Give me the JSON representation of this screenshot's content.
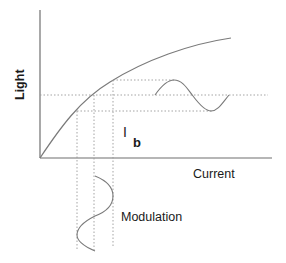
{
  "diagram": {
    "type": "laser light-current characteristic with modulation",
    "y_axis_label": "Light",
    "x_axis_label": "Current",
    "bias_label_main": "I",
    "bias_label_sub": "b",
    "modulation_label": "Modulation",
    "colors": {
      "axis": "#6f6f6f",
      "curve": "#7a7a7a",
      "guides": "#9a9a9a",
      "text": "#1a1a1a",
      "background": "#ffffff"
    },
    "elements": [
      "y-axis",
      "x-axis",
      "saturating L-I curve",
      "three dotted horizontal guide lines (max, bias, min light)",
      "three dotted vertical guide lines (min, bias, max current)",
      "output light sine wave (horizontal)",
      "input current modulation sine wave (vertical)"
    ]
  }
}
